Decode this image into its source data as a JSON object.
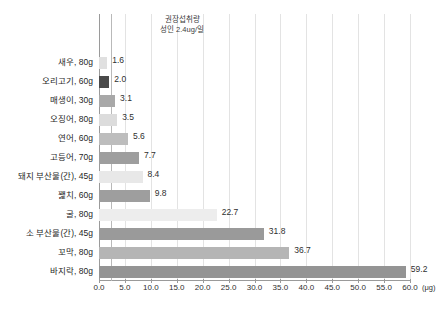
{
  "chart_data": {
    "type": "bar",
    "orientation": "horizontal",
    "title": "",
    "xlabel": "(μg)",
    "ylabel": "",
    "xlim": [
      0.0,
      60.0
    ],
    "xticks": [
      "0.0",
      "5.0",
      "10.0",
      "15.0",
      "20.0",
      "25.0",
      "30.0",
      "35.0",
      "40.0",
      "45.0",
      "50.0",
      "55.0",
      "60.0"
    ],
    "xtick_values": [
      0,
      5,
      10,
      15,
      20,
      25,
      30,
      35,
      40,
      45,
      50,
      55,
      60
    ],
    "unit_suffix": "(μg)",
    "grid": true,
    "legend": "none",
    "categories": [
      "새우, 80g",
      "오리고기, 60g",
      "매생이, 30g",
      "오징어, 80g",
      "연어, 60g",
      "고등어, 70g",
      "돼지 부산물(간), 45g",
      "꽱치, 60g",
      "굴, 80g",
      "소 부산물(간), 45g",
      "꼬막, 80g",
      "바지락, 80g"
    ],
    "values": [
      1.6,
      2.0,
      3.1,
      3.5,
      5.6,
      7.7,
      8.4,
      9.8,
      22.7,
      31.8,
      36.7,
      59.2
    ],
    "value_labels": [
      "1.6",
      "2.0",
      "3.1",
      "3.5",
      "5.6",
      "7.7",
      "8.4",
      "9.8",
      "22.7",
      "31.8",
      "36.7",
      "59.2"
    ],
    "bar_colors": [
      "#e0e0e0",
      "#4a4a4a",
      "#a8a8a8",
      "#dcdcdc",
      "#bdbdbd",
      "#9e9e9e",
      "#e8e8e8",
      "#9e9e9e",
      "#ededed",
      "#9a9a9a",
      "#b5b5b5",
      "#949494"
    ],
    "reference_line": {
      "value": 2.4,
      "color": "#b9b9b9",
      "annotation_line1": "권장섭취량",
      "annotation_line2": "성인 2.4ug/일"
    },
    "colors": {
      "background": "#ffffff",
      "grid": "#e3e3e3",
      "axis": "#9a9a9a",
      "text": "#1f1f1f"
    }
  }
}
